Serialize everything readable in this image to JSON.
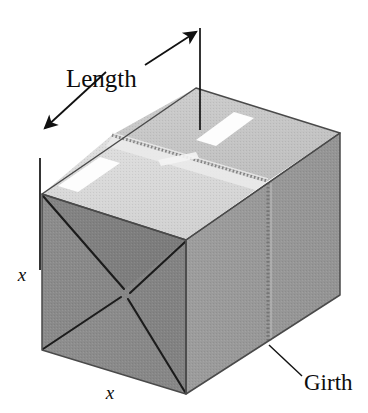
{
  "figure": {
    "type": "geometry-diagram",
    "background_color": "#ffffff",
    "labels": {
      "length": "Length",
      "girth": "Girth",
      "height_x": "x",
      "width_x": "x"
    },
    "colors": {
      "front_face": "#8a8a8a",
      "front_face_dark": "#7e7e7e",
      "right_face": "#9a9a9a",
      "top_face_near": "#d9d9d9",
      "top_face_far": "#c8c8c8",
      "top_flap_strip": "#e4e4e4",
      "label_sticker": "#fdfdfd",
      "outline": "#3a3a3a",
      "flap_line": "#1a1a1a",
      "tape_seam": "#8f8f8f",
      "annotation_line": "#111111",
      "text": "#0d0d0d"
    },
    "geometry": {
      "front_face": [
        [
          42,
          194
        ],
        [
          186,
          240
        ],
        [
          186,
          394
        ],
        [
          42,
          350
        ]
      ],
      "right_face": [
        [
          186,
          240
        ],
        [
          340,
          133
        ],
        [
          340,
          295
        ],
        [
          186,
          394
        ]
      ],
      "top_face": [
        [
          42,
          194
        ],
        [
          196,
          88
        ],
        [
          340,
          133
        ],
        [
          186,
          240
        ]
      ],
      "tape_seam_top": [
        [
          112,
          135
        ],
        [
          268,
          181
        ]
      ],
      "tape_seam_right_x": 268,
      "flap_center": [
        124,
        290
      ]
    },
    "annotations": {
      "length_tick_left": [
        [
          40,
          160
        ],
        [
          40,
          268
        ]
      ],
      "length_tick_right": [
        [
          200,
          26
        ],
        [
          200,
          128
        ]
      ],
      "length_arrow_left_tip": [
        40,
        130
      ],
      "length_arrow_right_tip": [
        200,
        30
      ],
      "girth_leader": [
        [
          268,
          320
        ],
        [
          300,
          352
        ]
      ]
    },
    "stickers": [
      {
        "name": "top-left-sticker",
        "points": [
          [
            58,
            186
          ],
          [
            100,
            157
          ],
          [
            118,
            163
          ],
          [
            76,
            192
          ]
        ]
      },
      {
        "name": "top-right-sticker",
        "points": [
          [
            196,
            140
          ],
          [
            234,
            112
          ],
          [
            252,
            118
          ],
          [
            214,
            146
          ]
        ]
      }
    ]
  }
}
